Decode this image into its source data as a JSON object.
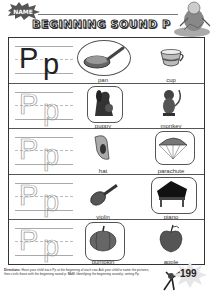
{
  "header": {
    "name_label": "NAME",
    "title": "BEGINNING SOUND P"
  },
  "letter": {
    "upper": "P",
    "lower": "p"
  },
  "rows": [
    {
      "trace_mode": "solid",
      "items": [
        {
          "label": "pan",
          "icon": "pan-icon",
          "circled": true
        },
        {
          "label": "cup",
          "icon": "cup-icon",
          "circled": false
        }
      ]
    },
    {
      "trace_mode": "dotted",
      "items": [
        {
          "label": "puppy",
          "icon": "puppy-icon",
          "circled": true
        },
        {
          "label": "monkey",
          "icon": "monkey-icon",
          "circled": false
        }
      ]
    },
    {
      "trace_mode": "dotted",
      "items": [
        {
          "label": "hat",
          "icon": "hat-icon",
          "circled": false
        },
        {
          "label": "parachute",
          "icon": "parachute-icon",
          "circled": true
        }
      ]
    },
    {
      "trace_mode": "dotted",
      "items": [
        {
          "label": "violin",
          "icon": "violin-icon",
          "circled": false
        },
        {
          "label": "piano",
          "icon": "piano-icon",
          "circled": true
        }
      ]
    },
    {
      "trace_mode": "dotted",
      "items": [
        {
          "label": "pumpkin",
          "icon": "pumpkin-icon",
          "circled": true
        },
        {
          "label": "apple",
          "icon": "apple-icon",
          "circled": false
        }
      ]
    }
  ],
  "footer": {
    "directions_label": "Directions:",
    "directions_text": "Have your child trace Pp at the beginning of each row. Ask your child to name the pictures, then circle those with the beginning sound p.",
    "skill_label": "Skill:",
    "skill_text": "Identifying the beginning sound p; writing Pp.",
    "page_number": "199"
  }
}
